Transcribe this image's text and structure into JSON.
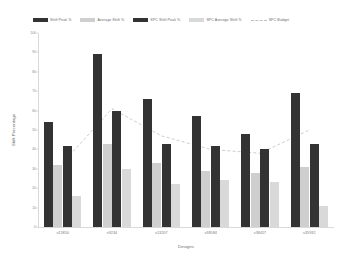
{
  "chart_data": {
    "type": "bar",
    "title": "",
    "xlabel": "Designs",
    "ylabel": "Shift Percentage",
    "ylim": [
      0,
      100
    ],
    "yticks": [
      0,
      10,
      20,
      30,
      40,
      50,
      60,
      70,
      80,
      90,
      100
    ],
    "ytick_labels": [
      "0",
      "10",
      "20",
      "30",
      "40",
      "50",
      "60",
      "70",
      "80",
      "90",
      "100"
    ],
    "grid": false,
    "legend_position": "top",
    "categories": [
      "s15850",
      "s9234",
      "s13207",
      "s38584",
      "s38417",
      "s35932"
    ],
    "series": [
      {
        "name": "Shift Peak %",
        "type": "bar",
        "color": "#333333",
        "values": [
          54,
          89,
          66,
          57,
          48,
          69
        ]
      },
      {
        "name": "Average Shift %",
        "type": "bar",
        "color": "#cfcfcf",
        "values": [
          32,
          43,
          33,
          29,
          28,
          31
        ]
      },
      {
        "name": "SPC Shift Peak %",
        "type": "bar",
        "color": "#333333",
        "values": [
          42,
          60,
          43,
          42,
          40,
          43
        ]
      },
      {
        "name": "SPC Average Shift %",
        "type": "bar",
        "color": "#d9d9d9",
        "values": [
          16,
          30,
          22,
          24,
          23,
          11
        ]
      },
      {
        "name": "SPC Budget",
        "type": "line",
        "color": "#bfbfbf",
        "style": "dashed",
        "values": [
          33,
          61,
          47,
          40,
          38,
          50
        ]
      }
    ]
  },
  "legend": {
    "items": [
      {
        "label": "Shift Peak %",
        "marker": "bar-swatch",
        "color": "#333333"
      },
      {
        "label": "Average Shift %",
        "marker": "bar-swatch",
        "color": "#cfcfcf"
      },
      {
        "label": "SPC Shift Peak %",
        "marker": "bar-swatch",
        "color": "#333333"
      },
      {
        "label": "SPC Average Shift %",
        "marker": "bar-swatch",
        "color": "#d9d9d9"
      },
      {
        "label": "SPC Budget",
        "marker": "dashed-line",
        "color": "#bfbfbf"
      }
    ]
  }
}
